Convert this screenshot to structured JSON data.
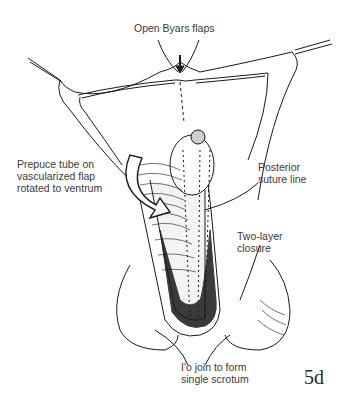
{
  "labels": {
    "top": "Open Byars flaps",
    "left": [
      "Prepuce tube on",
      "vascularized flap",
      "rotated to ventrum"
    ],
    "right_upper": [
      "Posterior",
      "suture line"
    ],
    "right_lower": [
      "Two-layer",
      "closure"
    ],
    "bottom": [
      "I'o join to form",
      "single scrotum"
    ]
  },
  "figure_number": "5d",
  "colors": {
    "ink": "#1a1a1a",
    "text": "#3a3a3a",
    "background": "#ffffff"
  }
}
